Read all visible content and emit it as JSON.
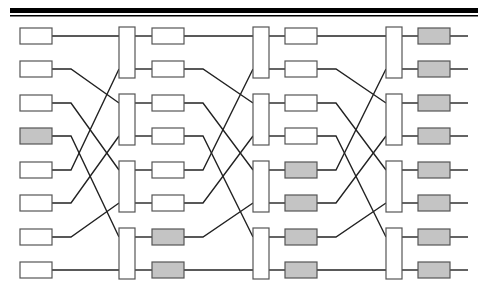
{
  "diagram": {
    "type": "shuffle-exchange network",
    "rows": 8,
    "row_y": [
      36,
      69,
      103,
      136,
      170,
      203,
      237,
      270
    ],
    "colors": {
      "line": "#222222",
      "box_border": "#555555",
      "box_fill": "#ffffff",
      "highlight_fill": "#c4c4c4",
      "switch_fill": "#ffffff",
      "border_bar": "#000000"
    },
    "top_border": {
      "x1": 10,
      "x2": 478,
      "thick_y": 8,
      "thick_h": 5,
      "thin_y": 15,
      "thin_h": 1.5
    },
    "box": {
      "w": 32,
      "h": 16
    },
    "switch": {
      "w": 16
    },
    "columns": [
      {
        "name": "input-column",
        "x": 20,
        "highlighted": [
          3
        ]
      },
      {
        "name": "stage-1-column",
        "x": 152,
        "highlighted": [
          6,
          7
        ]
      },
      {
        "name": "stage-2-column",
        "x": 285,
        "highlighted": [
          4,
          5,
          6,
          7
        ]
      },
      {
        "name": "output-column",
        "x": 418,
        "highlighted": [
          0,
          1,
          2,
          3,
          4,
          5,
          6,
          7
        ]
      }
    ],
    "switch_columns": [
      {
        "name": "switch-stage-1",
        "x": 119
      },
      {
        "name": "switch-stage-2",
        "x": 253
      },
      {
        "name": "switch-stage-3",
        "x": 386
      }
    ],
    "shuffle": [
      0,
      2,
      4,
      6,
      1,
      3,
      5,
      7
    ],
    "output_line_end_x": 468,
    "bend_offset": 19
  }
}
